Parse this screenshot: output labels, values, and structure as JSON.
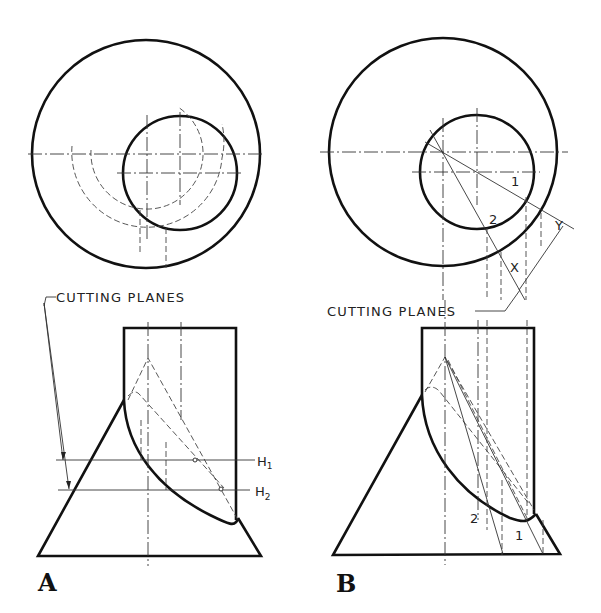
{
  "figure": {
    "panels": [
      {
        "id": "A",
        "label": "A",
        "cutting_planes_label": "CUTTING PLANES",
        "plane_labels": {
          "h1": "H",
          "h1_sub": "1",
          "h2": "H",
          "h2_sub": "2"
        },
        "method": "horizontal cutting planes"
      },
      {
        "id": "B",
        "label": "B",
        "cutting_planes_label": "CUTTING PLANES",
        "point_labels": {
          "p1": "1",
          "p2": "2",
          "x": "X",
          "y": "Y"
        },
        "method": "cutting planes through cone apex"
      }
    ],
    "colors": {
      "ink": "#111111",
      "background": "#ffffff"
    }
  }
}
